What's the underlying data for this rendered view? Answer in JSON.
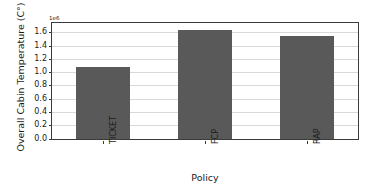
{
  "chart_data": {
    "type": "bar",
    "title": "",
    "xlabel": "Policy",
    "ylabel": "Overall Cabin Temperature (C°)",
    "categories": [
      "TICKET",
      "FCP",
      "RAP"
    ],
    "values": [
      1090000,
      1640000,
      1550000
    ],
    "values_scaled": [
      1.09,
      1.64,
      1.55
    ],
    "y_offset_text": "1e6",
    "y_scale_factor": 1000000,
    "ylim": [
      0.0,
      1.75
    ],
    "ytick_labels": [
      "0.0",
      "0.2",
      "0.4",
      "0.6",
      "0.8",
      "1.0",
      "1.2",
      "1.4",
      "1.6"
    ],
    "ytick_values": [
      0.0,
      0.2,
      0.4,
      0.6,
      0.8,
      1.0,
      1.2,
      1.4,
      1.6
    ],
    "grid": true,
    "grid_axis": "y",
    "legend": false,
    "bar_color": "#595959",
    "grid_color": "#d9d9d9",
    "axis_color": "#3a3a3a",
    "text_color": "#1a1a1a",
    "background_color": "#ffffff",
    "xtick_label_rotation": -90
  }
}
